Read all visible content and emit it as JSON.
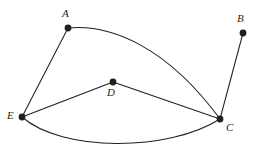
{
  "figure": {
    "kind": "undirected-graph-diagram",
    "width": 256,
    "height": 160,
    "background_color": "#ffffff",
    "ink_color": "#231f20"
  },
  "vertices": [
    {
      "id": "A",
      "label": "A",
      "x": 68,
      "y": 28,
      "r": 3.4,
      "label_x": 62,
      "label_y": 8,
      "degree": 2
    },
    {
      "id": "B",
      "label": "B",
      "x": 243,
      "y": 33,
      "r": 3.4,
      "label_x": 237,
      "label_y": 13,
      "degree": 1
    },
    {
      "id": "C",
      "label": "C",
      "x": 220,
      "y": 119,
      "r": 3.4,
      "label_x": 226,
      "label_y": 122,
      "degree": 4
    },
    {
      "id": "D",
      "label": "D",
      "x": 113,
      "y": 82,
      "r": 3.4,
      "label_x": 107,
      "label_y": 87,
      "degree": 2
    },
    {
      "id": "E",
      "label": "E",
      "x": 22,
      "y": 117,
      "r": 3.4,
      "label_x": 7,
      "label_y": 110,
      "degree": 3
    }
  ],
  "edges": [
    {
      "id": "edge-E-A",
      "from": "E",
      "to": "A",
      "shape": "straight",
      "path": "M 22 117 L 68 28"
    },
    {
      "id": "edge-A-C",
      "from": "A",
      "to": "C",
      "shape": "curved",
      "path": "M 68 28 C 112 24 168 48 220 119"
    },
    {
      "id": "edge-B-C",
      "from": "B",
      "to": "C",
      "shape": "straight",
      "path": "M 243 33 L 220 119"
    },
    {
      "id": "edge-E-D",
      "from": "E",
      "to": "D",
      "shape": "straight",
      "path": "M 22 117 L 113 82"
    },
    {
      "id": "edge-D-C",
      "from": "D",
      "to": "C",
      "shape": "straight",
      "path": "M 113 82 L 220 119"
    },
    {
      "id": "edge-E-C",
      "from": "E",
      "to": "C",
      "shape": "curved",
      "path": "M 22 117 C 62 152 168 152 220 119"
    }
  ]
}
